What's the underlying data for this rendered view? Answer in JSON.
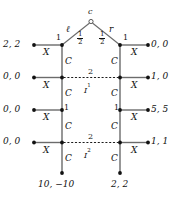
{
  "diagram": {
    "type": "extensive-form-game-tree",
    "chance_node": {
      "label": "c",
      "branches": [
        {
          "action": "ℓ",
          "probability_num": "1",
          "probability_den": "2"
        },
        {
          "action": "r",
          "probability_num": "1",
          "probability_den": "2"
        }
      ]
    },
    "players": {
      "p1": "1",
      "p2": "2"
    },
    "actions": {
      "exit": "X",
      "continue": "C"
    },
    "information_sets": [
      {
        "player": "2",
        "name": "I",
        "superscript": "1"
      },
      {
        "player": "2",
        "name": "I",
        "superscript": "2"
      }
    ],
    "left_branch": {
      "nodes": [
        {
          "player": "1",
          "exit_payoff": "2, 2"
        },
        {
          "player": "2",
          "exit_payoff": "0, 0"
        },
        {
          "player": "1",
          "exit_payoff": "0, 0"
        },
        {
          "player": "2",
          "exit_payoff": "0, 0"
        }
      ],
      "terminal_payoff": "10, −10"
    },
    "right_branch": {
      "nodes": [
        {
          "player": "1",
          "exit_payoff": "0, 0"
        },
        {
          "player": "2",
          "exit_payoff": "1, 0"
        },
        {
          "player": "1",
          "exit_payoff": "5, 5"
        },
        {
          "player": "2",
          "exit_payoff": "1, 1"
        }
      ],
      "terminal_payoff": "2, 2"
    },
    "colors": {
      "edge": "#6b6b6b",
      "node": "#111111",
      "text": "#111111"
    }
  }
}
